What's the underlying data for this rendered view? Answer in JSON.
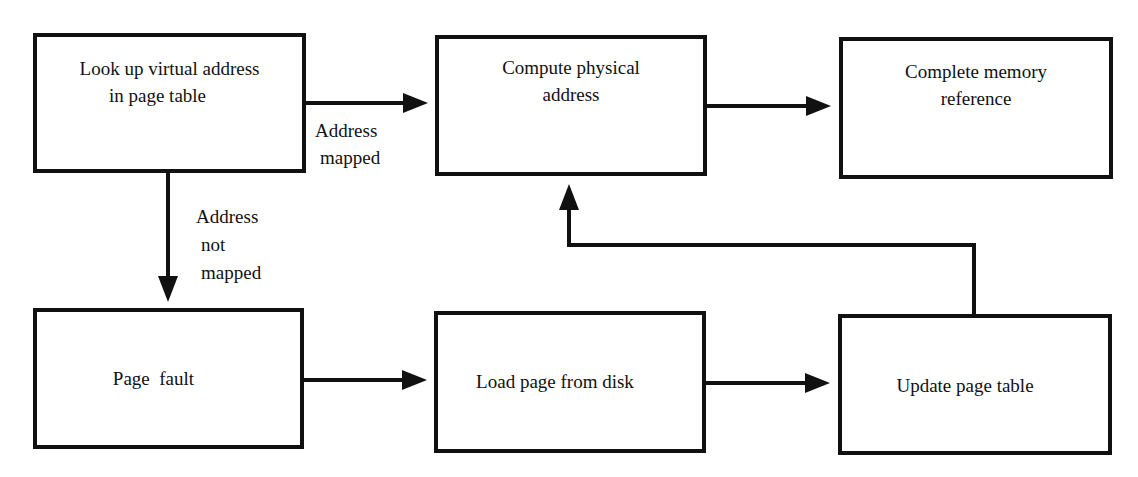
{
  "diagram": {
    "boxes": [
      {
        "id": "lookup",
        "lines": [
          "Look up virtual address",
          "in page table"
        ]
      },
      {
        "id": "compute",
        "lines": [
          "Compute physical",
          "address"
        ]
      },
      {
        "id": "complete",
        "lines": [
          "Complete memory",
          "reference"
        ]
      },
      {
        "id": "fault",
        "lines": [
          "Page  fault"
        ]
      },
      {
        "id": "load",
        "lines": [
          "Load page from disk"
        ]
      },
      {
        "id": "update",
        "lines": [
          "Update page table"
        ]
      }
    ],
    "edges": [
      {
        "from": "lookup",
        "to": "compute",
        "label": [
          "Address",
          "mapped"
        ]
      },
      {
        "from": "compute",
        "to": "complete",
        "label": []
      },
      {
        "from": "lookup",
        "to": "fault",
        "label": [
          "Address",
          "not",
          "mapped"
        ]
      },
      {
        "from": "fault",
        "to": "load",
        "label": []
      },
      {
        "from": "load",
        "to": "update",
        "label": []
      },
      {
        "from": "update",
        "to": "compute",
        "label": []
      }
    ],
    "colors": {
      "stroke": "#111111",
      "background": "#ffffff"
    }
  }
}
